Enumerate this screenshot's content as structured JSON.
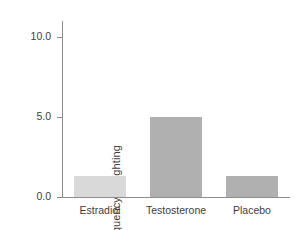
{
  "chart_data": {
    "type": "bar",
    "title": "",
    "subtitle": "",
    "xlabel": "",
    "ylabel": "Frequency of fighting",
    "categories": [
      "Estradiol",
      "Testosterone",
      "Placebo"
    ],
    "values": [
      1.3,
      5.0,
      1.3
    ],
    "bar_colors": [
      "#d9d9d9",
      "#b0b0b0",
      "#b0b0b0"
    ],
    "ylim": [
      0.0,
      11.0
    ],
    "yticks": [
      0.0,
      5.0,
      10.0
    ],
    "ytick_labels": [
      "0.0",
      "5.0",
      "10.0"
    ],
    "grid": false,
    "legend": false,
    "axis_color": "#8c8c8c",
    "text_color": "#3d3d3d",
    "background": "#ffffff"
  }
}
